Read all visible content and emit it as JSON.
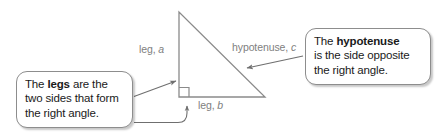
{
  "diagram": {
    "background_color": "#ffffff",
    "stroke_color": "#7a7a7a",
    "label_color": "#808080",
    "callout_border_color": "#8d8d8d",
    "callout_text_color": "#1a1a1a"
  },
  "labels": {
    "leg_a": {
      "prefix": "leg, ",
      "variable": "a"
    },
    "leg_b": {
      "prefix": "leg, ",
      "variable": "b"
    },
    "hypotenuse_c": {
      "prefix": "hypotenuse, ",
      "variable": "c"
    }
  },
  "callouts": {
    "legs": {
      "line1_pre": "The ",
      "line1_bold": "legs",
      "line1_post": " are the",
      "line2": "two sides that form",
      "line3": "the right angle."
    },
    "hypotenuse": {
      "line1_pre": "The ",
      "line1_bold": "hypotenuse",
      "line1_post": "",
      "line2": "is the side opposite",
      "line3": "the right angle."
    }
  },
  "shapes": {
    "triangle": {
      "apex": [
        179,
        12
      ],
      "right_angle_corner": [
        179,
        97
      ],
      "bottom_right": [
        265,
        97
      ]
    },
    "right_angle_marker_size": 10
  }
}
